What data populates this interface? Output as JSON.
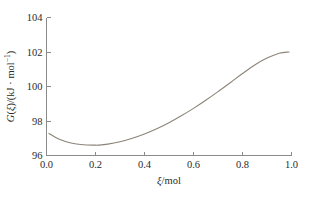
{
  "chart_data": {
    "type": "line",
    "title": "",
    "subtitle": "",
    "xlabel": "ξ/mol",
    "ylabel": "G(ξ)/(kJ · mol⁻¹)",
    "ylabel_parts": {
      "g_italic": "G",
      "open_paren": "(",
      "xi_italic": "ξ",
      "close_paren": ")/(kJ · mol",
      "superscript": "−1",
      "tail": ")"
    },
    "xlabel_parts": {
      "xi_italic": "ξ",
      "tail": "/mol"
    },
    "xlim": [
      0.0,
      1.0
    ],
    "ylim": [
      96,
      104
    ],
    "xticks": [
      0.0,
      0.2,
      0.4,
      0.6,
      0.8,
      1.0
    ],
    "xtick_labels": [
      "0.0",
      "0.2",
      "0.4",
      "0.6",
      "0.8",
      "1.0"
    ],
    "yticks": [
      96,
      98,
      100,
      102,
      104
    ],
    "ytick_labels": [
      "96",
      "98",
      "100",
      "102",
      "104"
    ],
    "grid": false,
    "legend": false,
    "legend_position": "none",
    "tick_direction": "in",
    "spines": [
      "left",
      "bottom"
    ],
    "line_color": "#8c8478",
    "axis_color": "#8a8a8a",
    "background_color": "#ffffff",
    "series": [
      {
        "name": "G(ξ)",
        "x": [
          0.01,
          0.05,
          0.1,
          0.15,
          0.2,
          0.21,
          0.25,
          0.3,
          0.35,
          0.4,
          0.45,
          0.5,
          0.55,
          0.6,
          0.65,
          0.7,
          0.75,
          0.8,
          0.85,
          0.9,
          0.95,
          0.99
        ],
        "values": [
          97.28,
          96.95,
          96.72,
          96.62,
          96.6,
          96.6,
          96.66,
          96.8,
          97.0,
          97.25,
          97.55,
          97.9,
          98.3,
          98.73,
          99.2,
          99.7,
          100.22,
          100.75,
          101.25,
          101.65,
          101.93,
          102.0
        ]
      }
    ],
    "annotations": [
      {
        "label": "minimum",
        "x": 0.21,
        "y": 96.6
      }
    ]
  },
  "figure": {
    "caption": "",
    "width_px": 314,
    "height_px": 201
  }
}
